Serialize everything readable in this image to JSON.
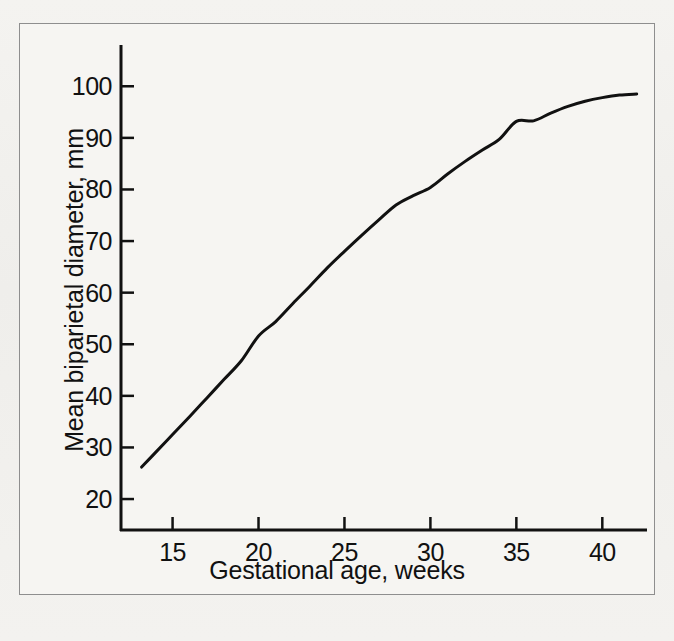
{
  "figure": {
    "background_color": "#f2f1ee",
    "frame_color": "#8e8e8e",
    "ink_color": "#111111"
  },
  "chart_data": {
    "type": "line",
    "title": "",
    "subtitle": "",
    "xlabel": "Gestational age, weeks",
    "ylabel": "Mean biparietal diameter, mm",
    "xlim": [
      12.0,
      42.6
    ],
    "ylim": [
      14.0,
      108.0
    ],
    "xticks": [
      15,
      20,
      25,
      30,
      35,
      40
    ],
    "xtick_labels": [
      "15",
      "20",
      "25",
      "30",
      "35",
      "40"
    ],
    "yticks": [
      20,
      30,
      40,
      50,
      60,
      70,
      80,
      90,
      100
    ],
    "ytick_labels": [
      "20",
      "30",
      "40",
      "50",
      "60",
      "70",
      "80",
      "90",
      "100"
    ],
    "grid": false,
    "legend": null,
    "tick_direction": "in",
    "series": [
      {
        "name": "Mean biparietal diameter",
        "color": "#111111",
        "line_width": 3,
        "x": [
          13.2,
          14,
          15,
          16,
          17,
          18,
          19,
          20,
          21,
          22,
          23,
          24,
          25,
          26,
          27,
          28,
          29,
          30,
          31,
          32,
          33,
          34,
          35,
          36,
          37,
          38,
          39,
          40,
          41,
          42.0
        ],
        "y": [
          26.2,
          29.0,
          32.5,
          36.0,
          39.6,
          43.2,
          46.8,
          51.6,
          54.4,
          57.9,
          61.3,
          64.8,
          68.0,
          71.1,
          74.1,
          77.0,
          78.8,
          80.4,
          83.0,
          85.4,
          87.6,
          89.7,
          93.2,
          93.3,
          94.8,
          96.1,
          97.1,
          97.8,
          98.3,
          98.5
        ]
      }
    ],
    "annotations": []
  },
  "axes": {
    "x_axis_name": "x-axis",
    "y_axis_name": "y-axis"
  }
}
